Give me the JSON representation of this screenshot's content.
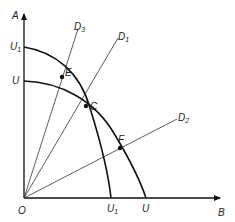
{
  "diagram": {
    "type": "utility-possibility-frontier",
    "axes": {
      "vertical": {
        "label": "A"
      },
      "horizontal": {
        "label": "B"
      },
      "origin": {
        "label": "O"
      }
    },
    "curves": [
      {
        "name": "U",
        "label_on_vertical": "U",
        "label_on_horizontal": "U"
      },
      {
        "name": "U1",
        "label_on_vertical": "U",
        "label_on_vertical_sub": "1",
        "label_on_horizontal": "U",
        "label_on_horizontal_sub": "1"
      }
    ],
    "rays": [
      {
        "label": "D",
        "sub": "3"
      },
      {
        "label": "D",
        "sub": "1"
      },
      {
        "label": "D",
        "sub": "2"
      }
    ],
    "points": [
      {
        "label": "E"
      },
      {
        "label": "C"
      },
      {
        "label": "F"
      }
    ]
  }
}
